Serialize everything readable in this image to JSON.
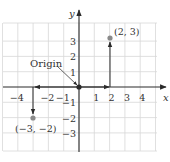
{
  "diagram": {
    "type": "coordinate-plane",
    "x_axis_label": "x",
    "y_axis_label": "y",
    "x_range": [
      -5,
      5
    ],
    "y_range": [
      -4,
      4
    ],
    "x_tick_labels": [
      {
        "value": -4,
        "text": "−4"
      },
      {
        "value": -2,
        "text": "−2"
      },
      {
        "value": -1,
        "text": "−1"
      },
      {
        "value": 1,
        "text": "1"
      },
      {
        "value": 2,
        "text": "2"
      },
      {
        "value": 3,
        "text": "3"
      },
      {
        "value": 4,
        "text": "4"
      }
    ],
    "y_tick_labels": [
      {
        "value": 3,
        "text": "3"
      },
      {
        "value": 2,
        "text": "2"
      },
      {
        "value": 1,
        "text": "1"
      },
      {
        "value": -1,
        "text": "−1"
      },
      {
        "value": -2,
        "text": "−2"
      },
      {
        "value": -3,
        "text": "−3"
      }
    ],
    "origin_label": "Origin",
    "points": [
      {
        "x": 2,
        "y": 3,
        "label": "(2, 3)"
      },
      {
        "x": -3,
        "y": -2,
        "label": "(−3, −2)"
      }
    ],
    "colors": {
      "grid": "#d8d8d8",
      "axis": "#2a2a2a",
      "point": "#8a8a8a",
      "text": "#333333"
    }
  }
}
